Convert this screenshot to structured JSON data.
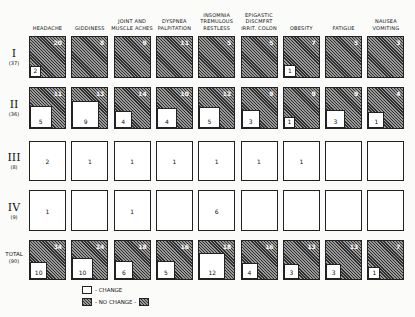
{
  "chart_data": {
    "type": "table",
    "title": "",
    "categories": [
      "HEADACHE",
      "GIDDINESS",
      "JOINT AND MUSCLE ACHES",
      "DYSPNEA PALPITATION",
      "INSOMNIA TREMULOUS RESTLESS",
      "EPIGASTIC DISCMFRT IRRIT. COLON",
      "OBESITY",
      "FATIGUE",
      "NAUSEA VOMITING"
    ],
    "rows": [
      {
        "label": "I",
        "n": "(37)",
        "change": [
          2,
          0,
          0,
          0,
          0,
          0,
          1,
          0,
          0
        ],
        "no_change": [
          20,
          8,
          9,
          11,
          5,
          5,
          7,
          5,
          3
        ]
      },
      {
        "label": "II",
        "n": "(36)",
        "change": [
          5,
          9,
          4,
          4,
          5,
          3,
          1,
          3,
          1
        ],
        "no_change": [
          11,
          13,
          14,
          10,
          12,
          9,
          9,
          9,
          4
        ]
      },
      {
        "label": "III",
        "n": "(8)",
        "change": [
          2,
          1,
          1,
          1,
          1,
          1,
          1,
          null,
          null
        ],
        "no_change": []
      },
      {
        "label": "IV",
        "n": "(9)",
        "change": [
          1,
          null,
          1,
          null,
          6,
          null,
          null,
          null,
          null
        ],
        "no_change": []
      },
      {
        "label": "TOTAL",
        "n": "(90)",
        "change": [
          10,
          10,
          6,
          5,
          12,
          4,
          3,
          3,
          1
        ],
        "no_change": [
          34,
          24,
          18,
          16,
          18,
          16,
          13,
          13,
          7
        ]
      }
    ],
    "legend": [
      "- CHANGE",
      "- NO CHANGE -"
    ]
  },
  "columns": [
    {
      "l1": "",
      "l2": "",
      "l3": "HEADACHE"
    },
    {
      "l1": "",
      "l2": "",
      "l3": "GIDDINESS"
    },
    {
      "l1": "",
      "l2": "JOINT AND",
      "l3": "MUSCLE ACHES"
    },
    {
      "l1": "",
      "l2": "DYSPNEA",
      "l3": "PALPITATION"
    },
    {
      "l1": "INSOMNIA",
      "l2": "TREMULOUS",
      "l3": "RESTLESS"
    },
    {
      "l1": "EPIGASTIC",
      "l2": "DISCMFRT",
      "l3": "IRRIT. COLON"
    },
    {
      "l1": "",
      "l2": "",
      "l3": "OBESITY"
    },
    {
      "l1": "",
      "l2": "",
      "l3": "FATIGUE"
    },
    {
      "l1": "",
      "l2": "NAUSEA",
      "l3": "VOMITING"
    }
  ],
  "rows": [
    {
      "roman": "I",
      "n": "(37)"
    },
    {
      "roman": "II",
      "n": "(36)"
    },
    {
      "roman": "III",
      "n": "(8)"
    },
    {
      "roman": "IV",
      "n": "(9)"
    },
    {
      "roman": "TOTAL",
      "n": "(90)"
    }
  ],
  "legend": {
    "change": "- CHANGE",
    "no_change": "- NO CHANGE -"
  }
}
